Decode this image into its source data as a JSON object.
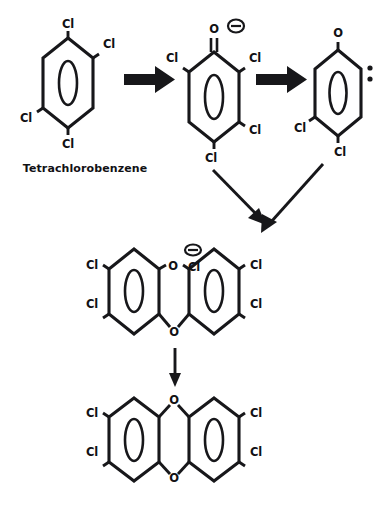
{
  "diagram": {
    "background_color": "#ffffff",
    "ink_color": "#17171a",
    "caption": "Tetrachlorobenzene",
    "structures": [
      {
        "id": "s1",
        "name": "tetrachlorobenzene",
        "labels": [
          "Cl",
          "Cl",
          "Cl",
          "Cl"
        ],
        "label_positions": [
          "top",
          "upper-right",
          "lower-left",
          "bottom"
        ]
      },
      {
        "id": "s2",
        "name": "tetrachlorophenolate-anion",
        "labels": [
          "O",
          "Cl",
          "Cl",
          "Cl",
          "Cl"
        ],
        "charge": "minus",
        "charge_symbol": "⊖"
      },
      {
        "id": "s3",
        "name": "chlorophenoxy-radical",
        "labels": [
          "O",
          "Cl",
          "Cl"
        ],
        "radical": "two-dots"
      },
      {
        "id": "s4",
        "name": "predioxin-ether-intermediate",
        "labels": [
          "Cl",
          "Cl",
          "O",
          "Cl",
          "Cl",
          "Cl",
          "O"
        ],
        "charge": "minus",
        "charge_symbol": "⊖"
      },
      {
        "id": "s5",
        "name": "tetrachlorodibenzo-p-dioxin",
        "labels": [
          "Cl",
          "Cl",
          "O",
          "O",
          "Cl",
          "Cl"
        ]
      }
    ],
    "atom_labels": {
      "chlorine": "Cl",
      "oxygen": "O"
    },
    "arrows": [
      {
        "id": "a1",
        "style": "bold",
        "direction": "right",
        "from": "s1",
        "to": "s2"
      },
      {
        "id": "a2",
        "style": "bold",
        "direction": "right",
        "from": "s2",
        "to": "s3"
      },
      {
        "id": "a3",
        "style": "thin",
        "direction": "down-right",
        "from": "s2",
        "to": "s4"
      },
      {
        "id": "a4",
        "style": "thin",
        "direction": "down-left",
        "from": "s3",
        "to": "s4"
      },
      {
        "id": "a5",
        "style": "thin",
        "direction": "down",
        "from": "s4",
        "to": "s5"
      }
    ]
  },
  "s1": {
    "cl_top": "Cl",
    "cl_upper_right": "Cl",
    "cl_lower_left": "Cl",
    "cl_bottom": "Cl"
  },
  "s2": {
    "o_top": "O",
    "charge": "⊖",
    "cl_upper_left": "Cl",
    "cl_upper_right": "Cl",
    "cl_lower_right": "Cl",
    "cl_bottom": "Cl"
  },
  "s3": {
    "o_top": "O",
    "cl_lower_left": "Cl",
    "cl_bottom": "Cl"
  },
  "s4": {
    "cl_left_upper": "Cl",
    "cl_left_lower": "Cl",
    "o_bridge_top": "O",
    "charge": "⊖",
    "cl_center": "Cl",
    "cl_right_upper": "Cl",
    "cl_right_lower": "Cl",
    "o_bridge_bottom": "O"
  },
  "s5": {
    "cl_left_upper": "Cl",
    "cl_left_lower": "Cl",
    "o_top": "O",
    "o_bottom": "O",
    "cl_right_upper": "Cl",
    "cl_right_lower": "Cl"
  },
  "caption": {
    "text": "Tetrachlorobenzene"
  }
}
